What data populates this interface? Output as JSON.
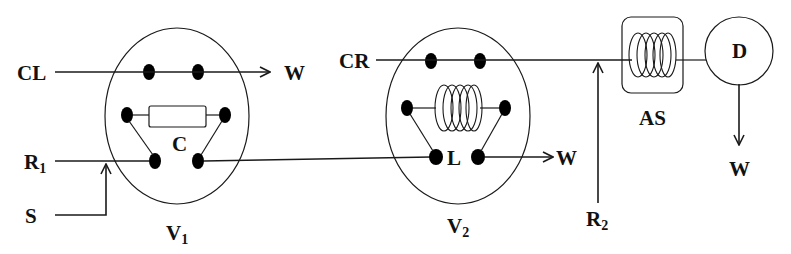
{
  "diagram": {
    "type": "valve-flow-schematic",
    "labels": {
      "cl": "CL",
      "cr": "CR",
      "r1_main": "R",
      "r1_sub": "1",
      "r2_main": "R",
      "r2_sub": "2",
      "s": "S",
      "w_top": "W",
      "w_mid": "W",
      "w_right": "W",
      "c": "C",
      "l": "L",
      "as": "AS",
      "d": "D",
      "v1_main": "V",
      "v1_sub": "1",
      "v2_main": "V",
      "v2_sub": "2"
    },
    "components": [
      {
        "id": "V1",
        "shape": "ellipse",
        "contains": "C (resistor/column)",
        "connects": [
          "CL→W",
          "R1→V2"
        ]
      },
      {
        "id": "V2",
        "shape": "ellipse",
        "contains": "L (coil/loop)",
        "connects": [
          "CR→AS",
          "V1→W"
        ]
      },
      {
        "id": "AS",
        "shape": "rounded-box",
        "contains": "coil"
      },
      {
        "id": "D",
        "shape": "circle",
        "outputs": "W"
      }
    ],
    "colors": {
      "stroke": "#1a1a1a",
      "background": "#ffffff",
      "node": "#000000"
    }
  }
}
